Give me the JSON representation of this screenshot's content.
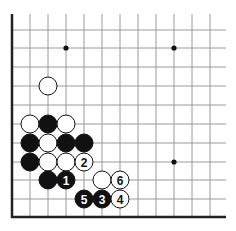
{
  "board": {
    "grid_x": [
      12,
      30,
      48,
      66,
      84,
      102,
      120,
      138,
      156,
      174,
      192,
      210
    ],
    "grid_y": [
      30,
      48,
      67,
      86,
      105,
      124,
      143,
      162,
      180,
      199,
      217
    ],
    "line_color": "#9a9a9a",
    "edge_color": "#222222",
    "edges": [
      "left",
      "bottom"
    ],
    "stone_radius": 9
  },
  "star_points": [
    {
      "col": 3,
      "row": 1
    },
    {
      "col": 9,
      "row": 1
    },
    {
      "col": 9,
      "row": 7
    }
  ],
  "stones": [
    {
      "color": "white",
      "col": 2,
      "row": 3,
      "label": ""
    },
    {
      "color": "white",
      "col": 1,
      "row": 5,
      "label": ""
    },
    {
      "color": "black",
      "col": 2,
      "row": 5,
      "label": ""
    },
    {
      "color": "white",
      "col": 3,
      "row": 5,
      "label": ""
    },
    {
      "color": "black",
      "col": 1,
      "row": 6,
      "label": ""
    },
    {
      "color": "white",
      "col": 2,
      "row": 6,
      "label": ""
    },
    {
      "color": "black",
      "col": 3,
      "row": 6,
      "label": ""
    },
    {
      "color": "black",
      "col": 4,
      "row": 6,
      "label": ""
    },
    {
      "color": "black",
      "col": 1,
      "row": 7,
      "label": ""
    },
    {
      "color": "white",
      "col": 2,
      "row": 7,
      "label": ""
    },
    {
      "color": "white",
      "col": 3,
      "row": 7,
      "label": ""
    },
    {
      "color": "white",
      "col": 4,
      "row": 7,
      "label": "2"
    },
    {
      "color": "black",
      "col": 2,
      "row": 8,
      "label": ""
    },
    {
      "color": "black",
      "col": 3,
      "row": 8,
      "label": "1"
    },
    {
      "color": "white",
      "col": 5,
      "row": 8,
      "label": ""
    },
    {
      "color": "white",
      "col": 6,
      "row": 8,
      "label": "6"
    },
    {
      "color": "black",
      "col": 4,
      "row": 9,
      "label": "5"
    },
    {
      "color": "black",
      "col": 5,
      "row": 9,
      "label": "3"
    },
    {
      "color": "white",
      "col": 6,
      "row": 9,
      "label": "4"
    }
  ]
}
